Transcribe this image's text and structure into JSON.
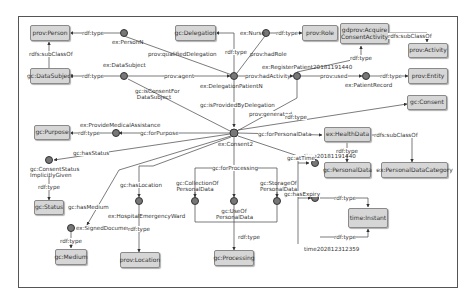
{
  "classes": {
    "prov_person": "prov:Person",
    "gc_datasubject": "gc:DataSubject",
    "gc_delegation": "gc:Delegation",
    "prov_role": "prov:Role",
    "gdprov_acquire": "gdprov:Acquire ConsentActivity",
    "prov_activity": "prov:Activity",
    "prov_entity": "prov:Entity",
    "gc_consent": "gc:Consent",
    "gc_purpose": "gc:Purpose",
    "ex_healthdata": "ex:HealthData",
    "gc_personaldata": "gc:PersonalData",
    "ex_personaldatacategory": "ex:PersonalDataCategory",
    "gc_status": "gc:Status",
    "gc_medium": "gc:Medium",
    "prov_location": "prov:Location",
    "gc_processing": "gc:Processing",
    "time_instant": "time:Instant"
  },
  "instances": {
    "personN": "ex:PersonN",
    "datasubject": "ex:DataSubject",
    "nurse": "ex:Nurse",
    "delegation": "ex:DelegationPatientN",
    "register": "ex:RegisterPatient20181191440",
    "patientrecord": "ex:PatientRecord",
    "consent2": "ex:Consent2",
    "provide": "ex:ProvideMedicalAssistance",
    "status": "gc:ConsentStatus ImplicitlyGiven",
    "signed": "ex:SignedDocument",
    "ward": "ex:HospitalEmergencyWard",
    "collection": "gc:CollectionOf PersonalData",
    "use": "gc:UseOf PersonalData",
    "storage": "gc:StorageOf PersonalData",
    "time1": "time20181191440",
    "time2": "time20281231235​9"
  },
  "edges": {
    "rdf_type": "rdf:type",
    "subclassof": "rdfs:subClassOf",
    "qualified_delegation": "prov:qualifiedDelegation",
    "had_role": "prov:hadRole",
    "agent": "prov:agent",
    "had_activity": "prov:hadActivity",
    "used": "prov:used",
    "is_consent_for": "gc:isConsentFor DataSubject",
    "provided_by": "gc:isProvidedByDelegation",
    "generated": "prov:generated",
    "for_purpose": "gc:forPurpose",
    "for_personal_data": "gc:forPersonalData",
    "has_status": "gc:hasStatus",
    "has_location": "gc:hasLocation",
    "for_processing": "gc:forProcessing",
    "at_time": "gc:atTime",
    "has_medium": "gc:hasMedium",
    "has_expiry": "gc:hasExpiry"
  }
}
